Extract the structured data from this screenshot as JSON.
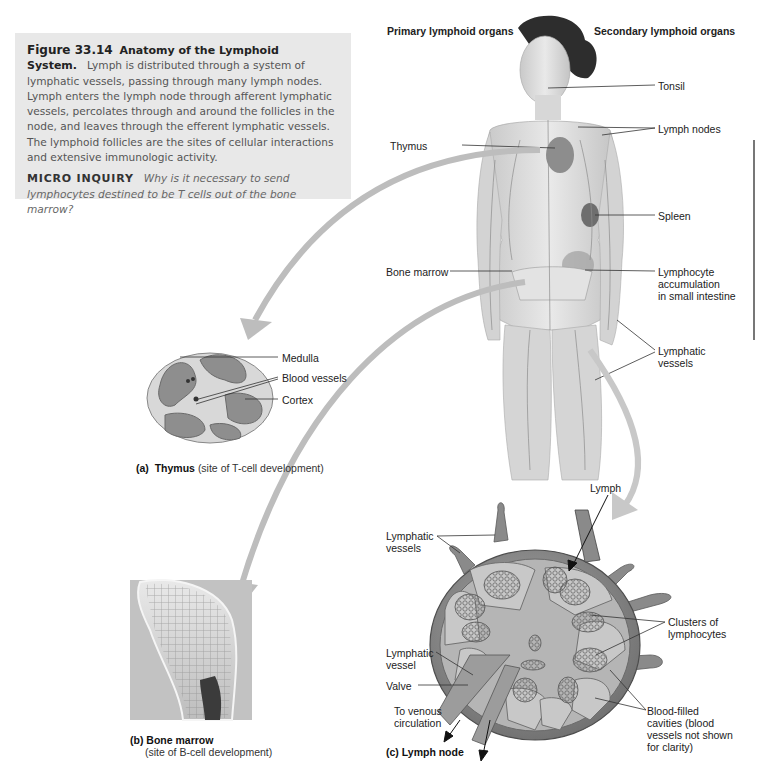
{
  "caption": {
    "figure_number": "Figure 33.14",
    "title": "Anatomy of the Lymphoid System.",
    "body": "Lymph is distributed through a system of lymphatic vessels, passing through many lymph nodes. Lymph enters the lymph node through afferent lymphatic vessels, percolates through and around the follicles in the node, and leaves through the efferent lymphatic vessels. The lymphoid follicles are the sites of cellular interactions and extensive immunologic activity.",
    "micro_inquiry_label": "MICRO INQUIRY",
    "micro_inquiry_text": "Why is it necessary to send lymphocytes destined to be T cells out of the bone marrow?"
  },
  "headers": {
    "primary": "Primary lymphoid organs",
    "secondary": "Secondary lymphoid organs"
  },
  "body_labels": {
    "tonsil": "Tonsil",
    "lymph_nodes": "Lymph nodes",
    "thymus": "Thymus",
    "spleen": "Spleen",
    "bone_marrow": "Bone marrow",
    "lymphocyte_accumulation": [
      "Lymphocyte",
      "accumulation",
      "in small intestine"
    ],
    "lymphatic_vessels": [
      "Lymphatic",
      "vessels"
    ]
  },
  "thymus_panel": {
    "labels": {
      "medulla": "Medulla",
      "blood_vessels": "Blood vessels",
      "cortex": "Cortex"
    },
    "caption_letter": "(a)",
    "caption_bold": "Thymus",
    "caption_rest": "(site of T-cell development)"
  },
  "bone_marrow_panel": {
    "caption_letter": "(b)",
    "caption_bold": "Bone marrow",
    "caption_rest": "(site of B-cell development)"
  },
  "lymph_node_panel": {
    "labels": {
      "lymph": "Lymph",
      "lymphatic_vessels": [
        "Lymphatic",
        "vessels"
      ],
      "clusters": [
        "Clusters of",
        "lymphocytes"
      ],
      "lymphatic_vessel": [
        "Lymphatic",
        "vessel"
      ],
      "valve": "Valve",
      "to_venous": [
        "To venous",
        "circulation"
      ],
      "blood_filled": [
        "Blood-filled",
        "cavities (blood",
        "vessels not shown",
        "for clarity)"
      ]
    },
    "caption_letter": "(c)",
    "caption_bold": "Lymph node"
  }
}
